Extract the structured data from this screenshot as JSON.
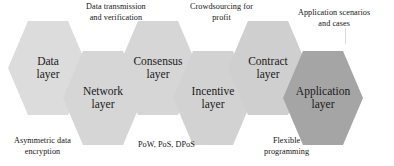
{
  "diagram": {
    "palette": {
      "hex_light": "#d9d9d9",
      "hex_light_2": "#d5d5d5",
      "hex_dark": "#a5a5a5",
      "background": "#ffffff",
      "label_text": "#1a1a1a",
      "caption_text": "#141414",
      "leader_line": "#d9d9d9"
    },
    "nodes": [
      {
        "id": "data-layer",
        "line1": "Data",
        "line2": "layer",
        "fill": "#dcdcdc",
        "row": "up",
        "x": 8
      },
      {
        "id": "network-layer",
        "line1": "Network",
        "line2": "layer",
        "fill": "#d6d6d6",
        "row": "down",
        "x": 63
      },
      {
        "id": "consensus-layer",
        "line1": "Consensus",
        "line2": "layer",
        "fill": "#d6d6d6",
        "row": "up",
        "x": 118
      },
      {
        "id": "incentive-layer",
        "line1": "Incentive",
        "line2": "layer",
        "fill": "#d2d2d2",
        "row": "down",
        "x": 173
      },
      {
        "id": "contract-layer",
        "line1": "Contract",
        "line2": "layer",
        "fill": "#cfcfcf",
        "row": "up",
        "x": 228
      },
      {
        "id": "application-layer",
        "line1": "Application",
        "line2": "layer",
        "fill": "#a5a5a5",
        "row": "down",
        "x": 283
      }
    ],
    "captions_top": [
      {
        "id": "data-transmission-and-verification",
        "line1": "Data transmission",
        "line2": "and verification",
        "x": 86,
        "y": 2
      },
      {
        "id": "crowdsourcing-for-profit",
        "line1": "Crowdsourcing for",
        "line2": "profit",
        "x": 190,
        "y": 2
      },
      {
        "id": "application-scenarios-and-cases",
        "line1": "Application scenarios",
        "line2": "and cases",
        "x": 298,
        "y": 8
      }
    ],
    "captions_bottom": [
      {
        "id": "asymmetric-data-encryption",
        "line1": "Asymmetric data",
        "line2": "encryption",
        "x": 14,
        "y": 136
      },
      {
        "id": "pow-pos-dpos",
        "line1": "PoW, PoS, DPoS",
        "line2": "",
        "x": 138,
        "y": 140
      },
      {
        "id": "flexible-programming",
        "line1": "Flexible",
        "line2": "programming",
        "x": 264,
        "y": 136
      }
    ],
    "leaders": [
      {
        "id": "leader-application-scenarios",
        "x": 345,
        "y": 28,
        "height": 16
      }
    ]
  }
}
